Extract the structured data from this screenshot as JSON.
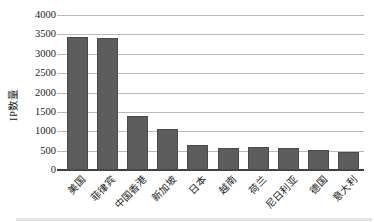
{
  "chart_data": {
    "type": "bar",
    "title": "",
    "xlabel": "",
    "ylabel": "IP数量",
    "categories": [
      "美国",
      "菲律宾",
      "中国香港",
      "新加坡",
      "日本",
      "越南",
      "荷兰",
      "尼日利亚",
      "德国",
      "意大利"
    ],
    "values": [
      3430,
      3400,
      1400,
      1050,
      650,
      580,
      590,
      570,
      510,
      470
    ],
    "ylim": [
      0,
      4000
    ],
    "ytick_step": 500,
    "yticks": [
      "0",
      "500",
      "1000",
      "1500",
      "2000",
      "2500",
      "3000",
      "3500",
      "4000"
    ],
    "grid": true,
    "legend": "none",
    "colors": {
      "bar": "#5d5d5d",
      "bar_border": "#4a4a4a",
      "gridline": "#b9b9b9",
      "axis_line": "#3f3f3f",
      "text": "#1c1c1c",
      "background": "#ffffff"
    }
  }
}
